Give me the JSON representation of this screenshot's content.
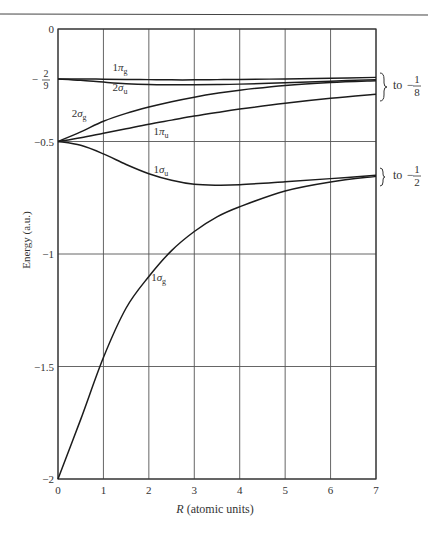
{
  "chart_data": {
    "type": "line",
    "title": "",
    "xlabel": "R (atomic units)",
    "ylabel": "Energy (a.u.)",
    "xlim": [
      0,
      7
    ],
    "ylim": [
      -2,
      0
    ],
    "grid": true,
    "x_ticks": [
      {
        "value": 0,
        "label": "0"
      },
      {
        "value": 1,
        "label": "1"
      },
      {
        "value": 2,
        "label": "2"
      },
      {
        "value": 3,
        "label": "3"
      },
      {
        "value": 4,
        "label": "4"
      },
      {
        "value": 5,
        "label": "5"
      },
      {
        "value": 6,
        "label": "6"
      },
      {
        "value": 7,
        "label": "7"
      }
    ],
    "y_ticks": [
      {
        "value": 0,
        "label": "0"
      },
      {
        "value": -0.2222,
        "label": "-2/9"
      },
      {
        "value": -0.5,
        "label": "-0.5"
      },
      {
        "value": -1,
        "label": "-1"
      },
      {
        "value": -1.5,
        "label": "-1.5"
      },
      {
        "value": -2,
        "label": "-2"
      }
    ],
    "x": [
      0,
      0.5,
      1,
      1.5,
      2,
      2.5,
      3,
      3.5,
      4,
      5,
      6,
      7
    ],
    "series": [
      {
        "name": "1πg",
        "values": [
          -0.222,
          -0.222,
          -0.223,
          -0.224,
          -0.225,
          -0.226,
          -0.226,
          -0.225,
          -0.224,
          -0.222,
          -0.219,
          -0.215
        ]
      },
      {
        "name": "2σu",
        "values": [
          -0.222,
          -0.228,
          -0.236,
          -0.243,
          -0.247,
          -0.248,
          -0.248,
          -0.247,
          -0.245,
          -0.239,
          -0.232,
          -0.225
        ]
      },
      {
        "name": "2σg",
        "values": [
          -0.5,
          -0.457,
          -0.41,
          -0.375,
          -0.347,
          -0.323,
          -0.303,
          -0.286,
          -0.272,
          -0.251,
          -0.238,
          -0.23
        ]
      },
      {
        "name": "1πu",
        "values": [
          -0.5,
          -0.483,
          -0.463,
          -0.443,
          -0.423,
          -0.405,
          -0.387,
          -0.371,
          -0.356,
          -0.33,
          -0.308,
          -0.29
        ]
      },
      {
        "name": "1σu",
        "values": [
          -0.5,
          -0.517,
          -0.555,
          -0.602,
          -0.643,
          -0.672,
          -0.69,
          -0.694,
          -0.692,
          -0.679,
          -0.665,
          -0.65
        ]
      },
      {
        "name": "1σg",
        "values": [
          -2.0,
          -1.735,
          -1.46,
          -1.24,
          -1.1,
          -0.985,
          -0.9,
          -0.835,
          -0.79,
          -0.72,
          -0.68,
          -0.655
        ]
      }
    ],
    "annotations": [
      {
        "text": "1πg",
        "x": 1.2,
        "y": -0.185
      },
      {
        "text": "2σu",
        "x": 1.2,
        "y": -0.275
      },
      {
        "text": "2σg",
        "x": 0.3,
        "y": -0.39
      },
      {
        "text": "1πu",
        "x": 2.1,
        "y": -0.47
      },
      {
        "text": "1σu",
        "x": 2.1,
        "y": -0.64
      },
      {
        "text": "1σg",
        "x": 2.05,
        "y": -1.12
      },
      {
        "text": "} to −1/8",
        "x": 7.05,
        "y": -0.23
      },
      {
        "text": "} to −1/2",
        "x": 7.05,
        "y": -0.655
      }
    ]
  },
  "labels": {
    "xlabel": "R (atomic units)",
    "ylabel": "Energy (a.u.)",
    "limit_upper": "to",
    "limit_upper_num": "1",
    "limit_upper_den": "8",
    "limit_lower": "to",
    "limit_lower_num": "1",
    "limit_lower_den": "2"
  }
}
